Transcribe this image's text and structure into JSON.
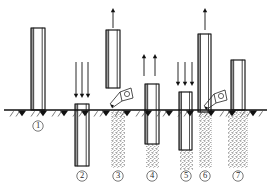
{
  "figure": {
    "type": "technical-diagram",
    "background_color": "#ffffff",
    "ink_color": "#111111",
    "fill_color": "#b4b4b4",
    "ground_line_y": 110,
    "stage_count": 7
  },
  "ground": {
    "label": "ground-surface-line",
    "y": 110,
    "x_start": 4,
    "x_end": 267,
    "triangle_positions": [
      22,
      43,
      64,
      85,
      106,
      127,
      148,
      169,
      190,
      211,
      232,
      253
    ],
    "hatch_positions": [
      10,
      16,
      31,
      37,
      52,
      58,
      73,
      79,
      94,
      100,
      115,
      121,
      136,
      142,
      157,
      163,
      178,
      184,
      199,
      205,
      220,
      226,
      241,
      247,
      259
    ]
  },
  "stages": [
    {
      "id": 1,
      "number_label": "①",
      "number_x": 38,
      "number_y": 126,
      "description": "Casing tube positioned upright on ground surface",
      "tube": {
        "x": 31,
        "y": 28,
        "width": 14,
        "height": 82,
        "below_ground": 0
      },
      "arrows": [],
      "fill_column": null,
      "hopper": false
    },
    {
      "id": 2,
      "number_label": "②",
      "number_x": 82,
      "number_y": 176,
      "description": "Tube driven down into ground by hammer blows",
      "tube": {
        "x": 75,
        "y": 104,
        "width": 14,
        "height": 62,
        "below_ground": 56
      },
      "arrows": [
        {
          "direction": "down",
          "x": 76,
          "y_start": 62,
          "y_end": 98
        },
        {
          "direction": "down",
          "x": 82,
          "y_start": 62,
          "y_end": 98
        },
        {
          "direction": "down",
          "x": 88,
          "y_start": 62,
          "y_end": 98
        }
      ],
      "fill_column": null,
      "hopper": false
    },
    {
      "id": 3,
      "number_label": "③",
      "number_x": 118,
      "number_y": 176,
      "description": "Tube withdrawn while aggregate is charged from hopper",
      "tube": {
        "x": 106,
        "y": 30,
        "width": 14,
        "height": 58,
        "below_ground": 0
      },
      "arrows": [
        {
          "direction": "up",
          "x": 113,
          "y_start": 8,
          "y_end": 28
        }
      ],
      "fill_column": {
        "x": 111,
        "y": 110,
        "width": 14,
        "height": 58
      },
      "hopper": true,
      "hopper_x": 118,
      "hopper_y": 96
    },
    {
      "id": 4,
      "number_label": "④",
      "number_x": 152,
      "number_y": 176,
      "description": "Tube lifted, aggregate discharges at base",
      "tube": {
        "x": 145,
        "y": 84,
        "width": 14,
        "height": 60,
        "below_ground": 34
      },
      "arrows": [
        {
          "direction": "up",
          "x": 144,
          "y_start": 54,
          "y_end": 76
        },
        {
          "direction": "up",
          "x": 155,
          "y_start": 54,
          "y_end": 76
        }
      ],
      "fill_column": {
        "x": 146,
        "y": 144,
        "width": 13,
        "height": 24
      },
      "hopper": false
    },
    {
      "id": 5,
      "number_label": "⑤",
      "number_x": 186,
      "number_y": 176,
      "description": "Tube re-driven to compact the aggregate plug",
      "tube": {
        "x": 179,
        "y": 92,
        "width": 13,
        "height": 58,
        "below_ground": 40
      },
      "arrows": [
        {
          "direction": "down",
          "x": 178,
          "y_start": 62,
          "y_end": 86
        },
        {
          "direction": "down",
          "x": 185,
          "y_start": 62,
          "y_end": 86
        },
        {
          "direction": "down",
          "x": 192,
          "y_start": 62,
          "y_end": 86
        }
      ],
      "fill_column": {
        "x": 180,
        "y": 150,
        "width": 13,
        "height": 20
      },
      "hopper": false
    },
    {
      "id": 6,
      "number_label": "⑥",
      "number_x": 205,
      "number_y": 176,
      "description": "Repeated lift and charge forming compacted shaft",
      "tube": {
        "x": 198,
        "y": 34,
        "width": 13,
        "height": 78,
        "below_ground": 2
      },
      "arrows": [
        {
          "direction": "up",
          "x": 205,
          "y_start": 8,
          "y_end": 30
        }
      ],
      "fill_column": {
        "x": 199,
        "y": 110,
        "width": 13,
        "height": 58
      },
      "hopper": true,
      "hopper_x": 212,
      "hopper_y": 98
    },
    {
      "id": 7,
      "number_label": "⑦",
      "number_x": 238,
      "number_y": 176,
      "description": "Completed compacted aggregate pile with tube removed",
      "tube": {
        "x": 231,
        "y": 60,
        "width": 14,
        "height": 50,
        "below_ground": 0
      },
      "arrows": [],
      "fill_column": {
        "x": 228,
        "y": 110,
        "width": 20,
        "height": 58
      },
      "hopper": false
    }
  ]
}
